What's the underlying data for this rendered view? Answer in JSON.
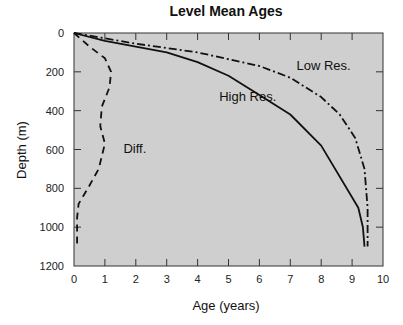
{
  "chart_data": {
    "type": "line",
    "title": "Level Mean Ages",
    "xlabel": "Age (years)",
    "ylabel": "Depth (m)",
    "xlim": [
      0,
      10
    ],
    "ylim": [
      1200,
      0
    ],
    "y_inverted": true,
    "xticks": [
      "0",
      "1",
      "2",
      "3",
      "4",
      "5",
      "6",
      "7",
      "8",
      "9",
      "10"
    ],
    "yticks": [
      "0",
      "200",
      "400",
      "600",
      "800",
      "1000",
      "1200"
    ],
    "grid": false,
    "legend": "none (inline annotations)",
    "background": "#cfcfcf",
    "series": [
      {
        "name": "High Res.",
        "style": "solid",
        "x": [
          0,
          1,
          2,
          3,
          4,
          5,
          6,
          7,
          8,
          9.2,
          9.35,
          9.4
        ],
        "y": [
          0,
          40,
          70,
          100,
          150,
          220,
          320,
          420,
          580,
          900,
          1000,
          1100
        ]
      },
      {
        "name": "Low Res.",
        "style": "dash-dot",
        "x": [
          0,
          2,
          4,
          6,
          7,
          8,
          8.6,
          9.1,
          9.4,
          9.5,
          9.5
        ],
        "y": [
          0,
          55,
          100,
          170,
          230,
          330,
          420,
          540,
          700,
          900,
          1100
        ]
      },
      {
        "name": "Diff.",
        "style": "dashed",
        "x": [
          0,
          0.5,
          1.0,
          1.2,
          1.15,
          0.9,
          0.85,
          1.0,
          0.8,
          0.45,
          0.15,
          0.1,
          0.1
        ],
        "y": [
          0,
          70,
          130,
          200,
          280,
          380,
          480,
          570,
          700,
          800,
          880,
          950,
          1110
        ]
      }
    ],
    "annotations": [
      {
        "text": "Low Res.",
        "x": 7.2,
        "y": 190
      },
      {
        "text": "High Res.",
        "x": 4.7,
        "y": 350
      },
      {
        "text": "Diff.",
        "x": 1.6,
        "y": 620
      }
    ]
  }
}
